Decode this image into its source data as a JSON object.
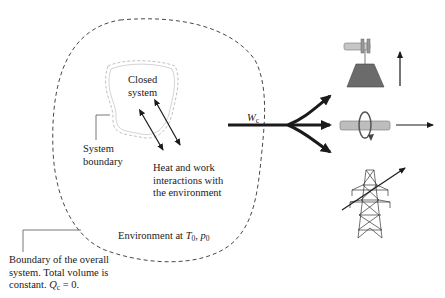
{
  "labels": {
    "closed_system_line1": "Closed",
    "closed_system_line2": "system",
    "system_boundary_line1": "System",
    "system_boundary_line2": "boundary",
    "interactions_line1": "Heat and work",
    "interactions_line2": "interactions with",
    "interactions_line3": "the environment",
    "environment_prefix": "Environment at ",
    "environment_T": "T",
    "environment_T_sub": "0",
    "environment_sep": ", ",
    "environment_p": "p",
    "environment_p_sub": "0",
    "work_symbol": "W",
    "work_sub": "c",
    "overall_line1": "Boundary of the overall",
    "overall_line2": "system. Total volume is",
    "overall_line3_prefix": "constant. ",
    "overall_Q": "Q",
    "overall_Q_sub": "c",
    "overall_line3_suffix": " = 0."
  },
  "icons": {
    "weight_lift": "raised-weight-pulley-icon",
    "rotating_shaft": "rotating-shaft-icon",
    "power_tower": "transmission-tower-icon"
  },
  "colors": {
    "line": "#1a1a1a",
    "dashed": "#333333",
    "boundary_inner": "#b0b0b0",
    "weight_fill": "#6b6b6b",
    "shaft_fill": "#bdbdbd"
  }
}
